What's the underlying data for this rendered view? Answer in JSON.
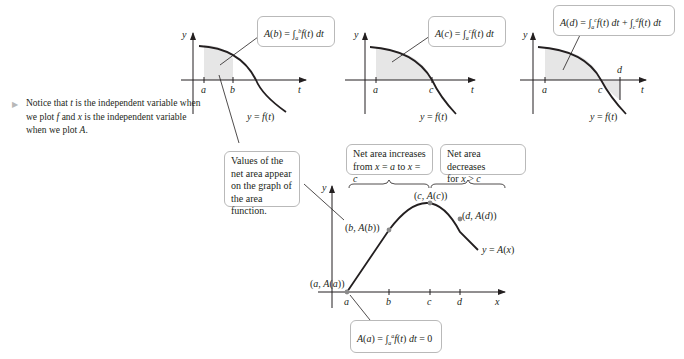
{
  "side_note": {
    "marker": "▶",
    "text": "Notice that t is the independent variable when we plot f and x is the independent variable when we plot A."
  },
  "panels": [
    {
      "id": "b",
      "y_axis": "y",
      "x_axis": "t",
      "ticks": [
        "a",
        "b"
      ],
      "curve_label": "y = f(t)",
      "formula": "A(b) = ∫ₐᵇ f(t) dt"
    },
    {
      "id": "c",
      "y_axis": "y",
      "x_axis": "t",
      "ticks": [
        "a",
        "c"
      ],
      "curve_label": "y = f(t)",
      "formula": "A(c) = ∫ₐᶜ f(t) dt"
    },
    {
      "id": "d",
      "y_axis": "y",
      "x_axis": "t",
      "ticks": [
        "a",
        "c",
        "d"
      ],
      "curve_label": "y = f(t)",
      "formula": "A(d) = ∫ₐᶜ f(t) dt + ∫꜀ᵈ f(t) dt"
    }
  ],
  "callouts": {
    "values": "Values of the net area appear on the graph of the area function.",
    "increase": "Net area increases from x = a to x = c",
    "decrease": "Net area decreases for x > c",
    "zero": "A(a) = ∫ₐᵃ f(t) dt = 0"
  },
  "area_graph": {
    "y_axis": "y",
    "x_axis": "x",
    "ticks": [
      "a",
      "b",
      "c",
      "d"
    ],
    "points": [
      "(a, A(a))",
      "(b, A(b))",
      "(c, A(c))",
      "(d, A(d))"
    ],
    "curve_label": "y = A(x)"
  },
  "colors": {
    "shade": "#e6e6e6",
    "curve": "#231f20",
    "box_border": "#b9b9b9",
    "point": "#8a8a8a"
  }
}
